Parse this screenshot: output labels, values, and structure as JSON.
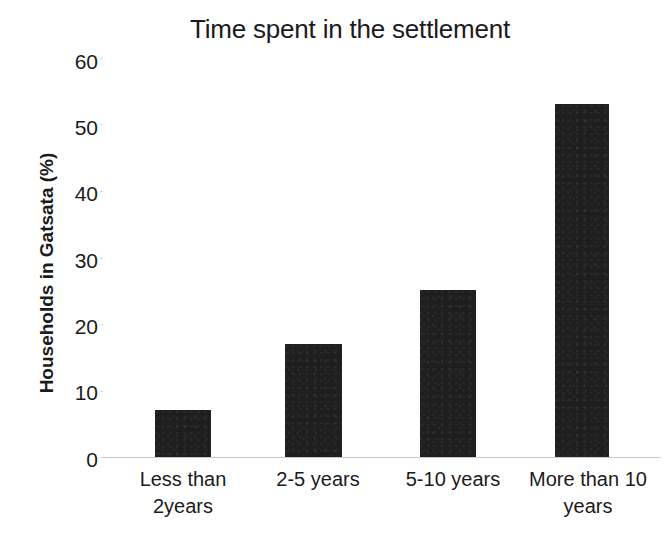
{
  "chart_data": {
    "type": "bar",
    "title": "Time spent in the settlement",
    "xlabel": "",
    "ylabel": "Households in Gatsata (%)",
    "categories": [
      "Less than 2years",
      "2-5 years",
      "5-10 years",
      "More than 10 years"
    ],
    "values": [
      7,
      17,
      25,
      53
    ],
    "ylim": [
      0,
      60
    ],
    "yticks": [
      0,
      10,
      20,
      30,
      40,
      50,
      60
    ],
    "ytick_labels": [
      "0",
      "10",
      "20",
      "30",
      "40",
      "50",
      "60"
    ],
    "grid": false,
    "legend": null,
    "bar_color": "#1f1f1f",
    "background_color": "#ffffff",
    "axis_line_color": "#c9c9c9",
    "series": [
      {
        "name": "Households in Gatsata (%)",
        "values": [
          7,
          17,
          25,
          53
        ]
      }
    ]
  },
  "category_label_lines": [
    [
      "Less than",
      "2years"
    ],
    [
      "2-5 years"
    ],
    [
      "5-10 years"
    ],
    [
      "More than 10",
      "years"
    ]
  ]
}
